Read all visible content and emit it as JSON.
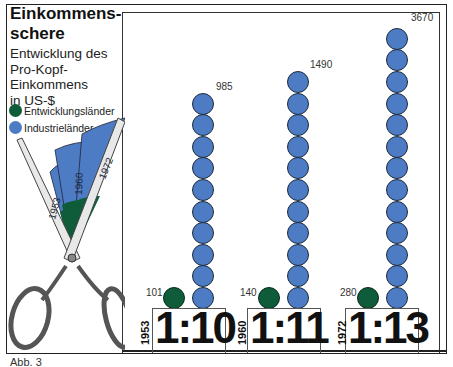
{
  "header": {
    "title_line1": "Einkommens-",
    "title_line2": "schere",
    "subtitle_lines": [
      "Entwicklung des",
      "Pro-Kopf-",
      "Einkommens",
      "in US-$"
    ]
  },
  "legend": {
    "items": [
      {
        "label": "Entwicklungsländer",
        "color": "#0e5c3a"
      },
      {
        "label": "Industrieländer",
        "color": "#4d7cc4"
      }
    ]
  },
  "fan_labels": [
    "1953",
    "1960",
    "1972"
  ],
  "caption": "Abb. 3",
  "groups": [
    {
      "year": "1953",
      "developing": "101",
      "industrial": "985",
      "ratio": "1:10",
      "circles": 10
    },
    {
      "year": "1960",
      "developing": "140",
      "industrial": "1490",
      "ratio": "1:11",
      "circles": 11
    },
    {
      "year": "1972",
      "developing": "280",
      "industrial": "3670",
      "ratio": "1:13",
      "circles": 13
    }
  ],
  "chart_data": {
    "type": "bar",
    "subtitle": "Entwicklung des Pro-Kopf-Einkommens in US-$",
    "categories": [
      "1953",
      "1960",
      "1972"
    ],
    "series": [
      {
        "name": "Entwicklungsländer",
        "values": [
          101,
          140,
          280
        ],
        "color": "#0e5c3a"
      },
      {
        "name": "Industrieländer",
        "values": [
          985,
          1490,
          3670
        ],
        "color": "#4d7cc4"
      }
    ],
    "ratios": [
      "1:10",
      "1:11",
      "1:13"
    ],
    "pictogram_units": {
      "Industrieländer": [
        10,
        11,
        13
      ],
      "Entwicklungsländer": [
        1,
        1,
        1
      ]
    },
    "xlabel": "",
    "ylabel": "US-$",
    "legend_position": "top-left",
    "grid": false,
    "annotation": "Abb. 3"
  }
}
